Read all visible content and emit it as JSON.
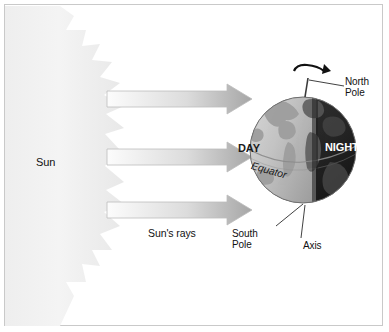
{
  "diagram": {
    "type": "earth-sun-day-night",
    "background_color": "#ffffff",
    "border_color": "#c9c9c9"
  },
  "sun": {
    "label": "Sun",
    "fill_color": "#efefef",
    "ray_count": 11,
    "position": "left edge, partial disc with pointed flame rays"
  },
  "rays": {
    "label": "Sun's rays",
    "arrow_count": 3,
    "direction": "left-to-right",
    "fill_start_color": "#fbfbfb",
    "fill_end_color": "#a9a9a9",
    "outline_color": "#b5b5b5",
    "arrows": [
      {
        "y": 97,
        "length": 145
      },
      {
        "y": 155,
        "length": 145
      },
      {
        "y": 208,
        "length": 145
      }
    ]
  },
  "globe": {
    "day_label": "DAY",
    "night_label": "NIGHT",
    "equator_label": "Equator",
    "north_pole_label": "North\nPole",
    "south_pole_label": "South\nPole",
    "axis_label": "Axis",
    "day_side_color": "#c2c2c2",
    "night_side_color": "#2a2a2a",
    "land_color": "#9a9a9a",
    "outline_color": "#6f6f6f",
    "terminator_note": "vertical day/night boundary, lit side faces the Sun",
    "rotation_arrow": "curved arrow over the North Pole showing rotation"
  }
}
